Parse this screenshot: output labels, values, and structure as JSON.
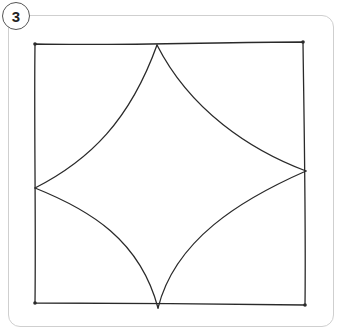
{
  "step": {
    "number": "3"
  },
  "drawing": {
    "stroke_color": "#2a2a2a",
    "frame_color": "#cfcfcf",
    "square_corners": {
      "top_left": [
        35,
        44
      ],
      "top_right": [
        303,
        42
      ],
      "bottom_right": [
        305,
        305
      ],
      "bottom_left": [
        35,
        303
      ]
    },
    "star_points": {
      "top": [
        157,
        45
      ],
      "right": [
        306,
        171
      ],
      "bottom": [
        158,
        308
      ],
      "left": [
        35,
        188
      ]
    }
  }
}
